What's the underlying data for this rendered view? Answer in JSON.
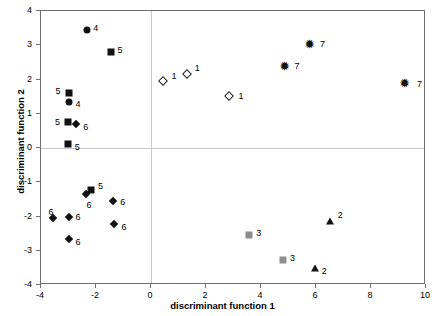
{
  "chart_data": {
    "type": "scatter",
    "title": "",
    "xlabel": "discriminant function 1",
    "ylabel": "discriminant function 2",
    "xlim": [
      -4,
      10
    ],
    "ylim": [
      -4,
      4
    ],
    "xticks": [
      -4,
      -2,
      0,
      2,
      4,
      6,
      8,
      10
    ],
    "yticks": [
      -4,
      -3,
      -2,
      -1,
      0,
      1,
      2,
      3,
      4
    ],
    "xticklabels": [
      "-4",
      "-2",
      "0",
      "2",
      "4",
      "6",
      "8",
      "10"
    ],
    "yticklabels": [
      "-4",
      "-3",
      "-2",
      "-1",
      "0",
      "1",
      "2",
      "3",
      "4"
    ],
    "grid": false,
    "zero_lines": true,
    "legend": "none",
    "point_labels": true,
    "series": [
      {
        "name": "1",
        "marker": "diamond-open",
        "color": "#ffffff",
        "edge_color": "#222222",
        "points": [
          {
            "x": 0.45,
            "y": 1.97,
            "label": "1"
          },
          {
            "x": 1.3,
            "y": 2.17,
            "label": "1"
          },
          {
            "x": 2.82,
            "y": 1.51,
            "label": "1"
          }
        ]
      },
      {
        "name": "2",
        "marker": "triangle",
        "color": "#111111",
        "points": [
          {
            "x": 6.5,
            "y": -2.12,
            "label": "2"
          },
          {
            "x": 5.95,
            "y": -3.5,
            "label": "2"
          }
        ]
      },
      {
        "name": "3",
        "marker": "square-gray",
        "color": "#8d8d8d",
        "points": [
          {
            "x": 3.57,
            "y": -2.54,
            "label": "3"
          },
          {
            "x": 4.8,
            "y": -3.27,
            "label": "3"
          }
        ]
      },
      {
        "name": "4",
        "marker": "circle",
        "color": "#111111",
        "points": [
          {
            "x": -2.32,
            "y": 3.44,
            "label": "4"
          },
          {
            "x": -3.0,
            "y": 1.33,
            "label": "4"
          }
        ]
      },
      {
        "name": "5",
        "marker": "square",
        "color": "#111111",
        "points": [
          {
            "x": -1.44,
            "y": 2.79,
            "label": "5"
          },
          {
            "x": -3.0,
            "y": 1.61,
            "label": "5"
          },
          {
            "x": -3.02,
            "y": 0.75,
            "label": "5"
          },
          {
            "x": -3.03,
            "y": 0.13,
            "label": "5"
          },
          {
            "x": -2.18,
            "y": -1.22,
            "label": "5"
          }
        ]
      },
      {
        "name": "6",
        "marker": "diamond",
        "color": "#111111",
        "points": [
          {
            "x": -2.72,
            "y": 0.71,
            "label": "6"
          },
          {
            "x": -2.38,
            "y": -1.35,
            "label": "6"
          },
          {
            "x": -1.37,
            "y": -1.56,
            "label": "6"
          },
          {
            "x": -3.58,
            "y": -2.05,
            "label": "6"
          },
          {
            "x": -3.0,
            "y": -2.0,
            "label": "6"
          },
          {
            "x": -1.33,
            "y": -2.23,
            "label": "6"
          },
          {
            "x": -3.0,
            "y": -2.67,
            "label": "6"
          }
        ]
      },
      {
        "name": "7",
        "marker": "star",
        "color": "#111111",
        "glyph": "✹",
        "points": [
          {
            "x": 5.78,
            "y": 3.03,
            "label": "7"
          },
          {
            "x": 4.85,
            "y": 2.38,
            "label": "7"
          },
          {
            "x": 9.2,
            "y": 1.89,
            "label": "7"
          }
        ]
      }
    ]
  },
  "label_offsets": {
    "1": [
      {
        "dx": 8,
        "dy": -9
      },
      {
        "dx": 8,
        "dy": -10
      },
      {
        "dx": 10,
        "dy": -4
      }
    ],
    "2": [
      {
        "dx": 8,
        "dy": -10
      },
      {
        "dx": 7,
        "dy": -1
      }
    ],
    "3": [
      {
        "dx": 7,
        "dy": -6
      },
      {
        "dx": 7,
        "dy": -6
      }
    ],
    "4": [
      {
        "dx": 6,
        "dy": -6
      },
      {
        "dx": 7,
        "dy": -2
      }
    ],
    "5": [
      {
        "dx": 6,
        "dy": -6
      },
      {
        "dx": -13,
        "dy": -6
      },
      {
        "dx": -13,
        "dy": -4
      },
      {
        "dx": 7,
        "dy": -1
      },
      {
        "dx": 7,
        "dy": -8
      }
    ],
    "6": [
      {
        "dx": 7,
        "dy": -1
      },
      {
        "dx": 1,
        "dy": 7
      },
      {
        "dx": 7,
        "dy": -3
      },
      {
        "dx": -4,
        "dy": -10
      },
      {
        "dx": 7,
        "dy": -4
      },
      {
        "dx": 7,
        "dy": -1
      },
      {
        "dx": 7,
        "dy": -1
      }
    ],
    "7": [
      {
        "dx": 10,
        "dy": -4
      },
      {
        "dx": 10,
        "dy": -4
      },
      {
        "dx": 13,
        "dy": -3
      }
    ]
  }
}
